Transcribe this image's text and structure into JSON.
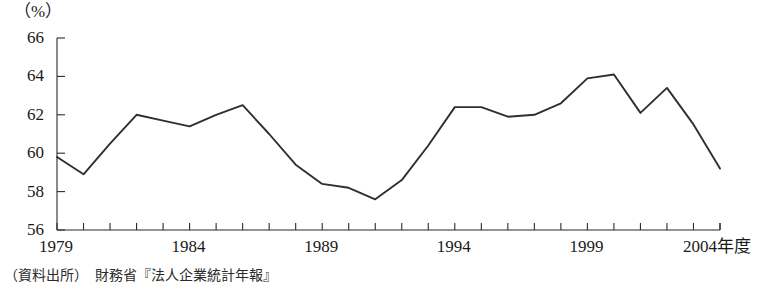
{
  "figure": {
    "unit_label": "（%）",
    "source_note": "（資料出所）　財務省『法人企業統計年報』"
  },
  "chart_data": {
    "type": "line",
    "title": "",
    "xlabel": "",
    "ylabel": "",
    "unit": "%",
    "grid": false,
    "legend": "none",
    "xlim": [
      1979,
      2004
    ],
    "ylim": [
      56,
      66
    ],
    "ytick_labels": [
      "66",
      "64",
      "62",
      "60",
      "58",
      "56"
    ],
    "ytick_values": [
      66,
      64,
      62,
      60,
      58,
      56
    ],
    "xtick_labels": [
      "1979",
      "1984",
      "1989",
      "1994",
      "1999",
      "2004年度"
    ],
    "xtick_values": [
      1979,
      1984,
      1989,
      1994,
      1999,
      2004
    ],
    "minor_xticks_every": 1,
    "x": [
      1979,
      1980,
      1981,
      1982,
      1983,
      1984,
      1985,
      1986,
      1987,
      1988,
      1989,
      1990,
      1991,
      1992,
      1993,
      1994,
      1995,
      1996,
      1997,
      1998,
      1999,
      2000,
      2001,
      2002,
      2003,
      2004
    ],
    "values": [
      59.8,
      58.9,
      60.5,
      62.0,
      61.7,
      61.4,
      62.0,
      62.5,
      61.0,
      59.4,
      58.4,
      58.2,
      57.6,
      58.6,
      60.4,
      62.4,
      62.4,
      61.9,
      62.0,
      62.6,
      63.9,
      64.1,
      62.1,
      63.4,
      61.5,
      59.2
    ],
    "series": [
      {
        "name": "",
        "color": "#2f2f2f",
        "values": [
          59.8,
          58.9,
          60.5,
          62.0,
          61.7,
          61.4,
          62.0,
          62.5,
          61.0,
          59.4,
          58.4,
          58.2,
          57.6,
          58.6,
          60.4,
          62.4,
          62.4,
          61.9,
          62.0,
          62.6,
          63.9,
          64.1,
          62.1,
          63.4,
          61.5,
          59.2
        ]
      }
    ]
  }
}
